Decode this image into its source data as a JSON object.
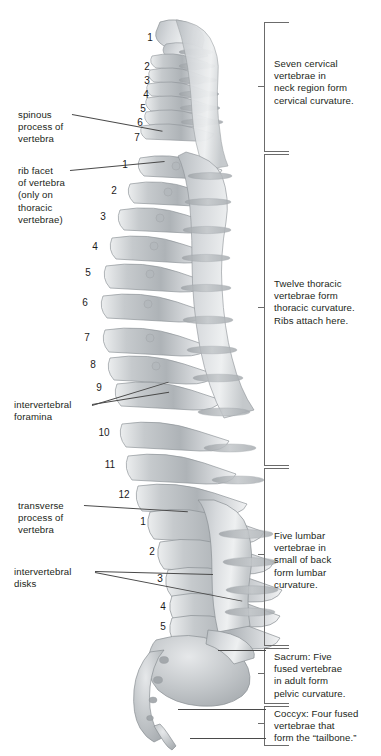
{
  "figure": {
    "background_color": "#ffffff",
    "bone_color": "#c9cccf",
    "text_color": "#231f20",
    "leader_color": "#4a4a4a",
    "bracket_color": "#6b6b6b"
  },
  "region_labels": [
    {
      "id": "cervical",
      "text": "Seven cervical\nvertebrae in\nneck region form\ncervical curvature.",
      "bracket_top": 22,
      "bracket_bottom": 150,
      "text_top": 58
    },
    {
      "id": "thoracic",
      "text": "Twelve thoracic\nvertebrae form\nthoracic curvature.\nRibs attach here.",
      "bracket_top": 154,
      "bracket_bottom": 464,
      "text_top": 278
    },
    {
      "id": "lumbar",
      "text": "Five lumbar\nvertebrae in\nsmall of back\nform lumbar\ncurvature.",
      "bracket_top": 468,
      "bracket_bottom": 644,
      "text_top": 530
    },
    {
      "id": "sacrum",
      "text": "Sacrum: Five\nfused vertebrae\nin adult form\npelvic curvature.",
      "bracket_top": 648,
      "bracket_bottom": 702,
      "text_top": 651
    },
    {
      "id": "coccyx",
      "text": "Coccyx: Four fused\nvertebrae that\nform the “tailbone.”",
      "bracket_top": 706,
      "bracket_bottom": 744,
      "text_top": 708
    }
  ],
  "part_labels": [
    {
      "id": "spinous-process",
      "text": "spinous\nprocess of\nvertebra",
      "left": 18,
      "top": 109
    },
    {
      "id": "rib-facet",
      "text": "rib facet\nof vertebra\n(only on\nthoracic\nvertebrae)",
      "left": 18,
      "top": 165
    },
    {
      "id": "intervertebral-foramina",
      "text": "intervertebral\nforamina",
      "left": 14,
      "top": 399
    },
    {
      "id": "transverse-process",
      "text": "transverse\nprocess of\nvertebra",
      "left": 18,
      "top": 500
    },
    {
      "id": "intervertebral-disks",
      "text": "intervertebral\ndisks",
      "left": 14,
      "top": 566
    }
  ],
  "vertebra_numbers": {
    "cervical": [
      {
        "n": "1",
        "left": 143,
        "top": 33
      },
      {
        "n": "2",
        "left": 140,
        "top": 62
      },
      {
        "n": "3",
        "left": 140,
        "top": 76
      },
      {
        "n": "4",
        "left": 139,
        "top": 90
      },
      {
        "n": "5",
        "left": 136,
        "top": 104
      },
      {
        "n": "6",
        "left": 133,
        "top": 118
      },
      {
        "n": "7",
        "left": 130,
        "top": 133
      }
    ],
    "thoracic": [
      {
        "n": "1",
        "left": 118,
        "top": 160
      },
      {
        "n": "2",
        "left": 107,
        "top": 186
      },
      {
        "n": "3",
        "left": 96,
        "top": 212
      },
      {
        "n": "4",
        "left": 88,
        "top": 242
      },
      {
        "n": "5",
        "left": 81,
        "top": 268
      },
      {
        "n": "6",
        "left": 78,
        "top": 298
      },
      {
        "n": "7",
        "left": 80,
        "top": 333
      },
      {
        "n": "8",
        "left": 86,
        "top": 360
      },
      {
        "n": "9",
        "left": 92,
        "top": 383
      },
      {
        "n": "10",
        "left": 97,
        "top": 428
      },
      {
        "n": "11",
        "left": 103,
        "top": 460
      },
      {
        "n": "12",
        "left": 117,
        "top": 490
      }
    ],
    "lumbar": [
      {
        "n": "1",
        "left": 136,
        "top": 517
      },
      {
        "n": "2",
        "left": 145,
        "top": 547
      },
      {
        "n": "3",
        "left": 153,
        "top": 574
      },
      {
        "n": "4",
        "left": 156,
        "top": 602
      },
      {
        "n": "5",
        "left": 156,
        "top": 622
      }
    ]
  },
  "leader_lines": [
    {
      "id": "spinous-process-leader",
      "x": 72,
      "y": 114,
      "length": 92,
      "angle": 10.5
    },
    {
      "id": "rib-facet-leader",
      "x": 70,
      "y": 170,
      "length": 95,
      "angle": -5.5
    },
    {
      "id": "foramina-leader-a",
      "x": 92,
      "y": 404,
      "length": 78,
      "angle": -9
    },
    {
      "id": "foramina-leader-b",
      "x": 92,
      "y": 405,
      "length": 80,
      "angle": -17
    },
    {
      "id": "transverse-process-leader",
      "x": 84,
      "y": 505,
      "length": 104,
      "angle": 3.5
    },
    {
      "id": "disks-leader-a",
      "x": 95,
      "y": 572,
      "length": 120,
      "angle": 11
    },
    {
      "id": "disks-leader-b",
      "x": 95,
      "y": 571,
      "length": 115,
      "angle": 3
    },
    {
      "id": "sacrum-leader",
      "x": 218,
      "y": 650,
      "length": 48,
      "angle": 0
    },
    {
      "id": "coccyx-leader-a",
      "x": 178,
      "y": 709,
      "length": 88,
      "angle": 0
    },
    {
      "id": "coccyx-leader-b",
      "x": 190,
      "y": 738,
      "length": 76,
      "angle": 0
    }
  ]
}
